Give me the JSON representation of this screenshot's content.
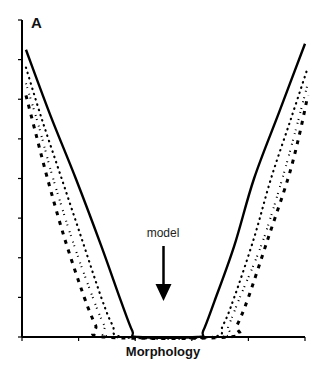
{
  "chart_data": {
    "type": "line",
    "title": "",
    "panel_label": "A",
    "xlabel": "Morphology",
    "ylabel": "",
    "x_tick_count": 6,
    "y_tick_count": 9,
    "x_tick_labels": [],
    "y_tick_labels": [],
    "xlim": [
      0,
      5
    ],
    "ylim": [
      0,
      8
    ],
    "grid": false,
    "legend": null,
    "annotations": [
      {
        "text": "model",
        "type": "arrow-down",
        "x": 2.5,
        "y_text": 2.6,
        "y_arrow_end": 0.9
      }
    ],
    "series": [
      {
        "name": "solid",
        "style": "solid",
        "x": [
          0.07,
          0.5,
          0.95,
          1.4,
          1.75,
          1.95,
          2.05,
          3.1,
          3.2,
          3.4,
          3.75,
          4.1,
          4.55,
          5.0
        ],
        "y": [
          7.25,
          5.6,
          4.0,
          2.3,
          0.9,
          0.15,
          0.0,
          0.0,
          0.15,
          0.9,
          2.3,
          4.0,
          5.7,
          7.4
        ]
      },
      {
        "name": "dotted",
        "style": "dotted",
        "x": [
          0.07,
          0.35,
          0.7,
          1.05,
          1.4,
          1.6,
          1.8,
          3.35,
          3.55,
          3.75,
          4.1,
          4.4,
          4.75,
          5.05
        ],
        "y": [
          6.8,
          5.5,
          4.0,
          2.5,
          1.0,
          0.3,
          0.0,
          0.0,
          0.3,
          1.0,
          2.5,
          4.0,
          5.5,
          6.8
        ]
      },
      {
        "name": "dash-dot",
        "style": "dashdot",
        "x": [
          0.07,
          0.3,
          0.55,
          0.9,
          1.25,
          1.45,
          1.6,
          3.5,
          3.65,
          3.85,
          4.25,
          4.6,
          4.85,
          5.05
        ],
        "y": [
          6.4,
          5.3,
          4.0,
          2.4,
          1.0,
          0.3,
          0.0,
          0.0,
          0.3,
          1.0,
          2.4,
          4.0,
          5.3,
          6.4
        ]
      },
      {
        "name": "dashed",
        "style": "dashed",
        "x": [
          0.07,
          0.25,
          0.45,
          0.75,
          1.1,
          1.3,
          1.45,
          3.65,
          3.8,
          4.0,
          4.35,
          4.7,
          4.9,
          5.05
        ],
        "y": [
          6.1,
          5.1,
          4.0,
          2.5,
          1.0,
          0.3,
          0.0,
          0.0,
          0.3,
          1.0,
          2.5,
          4.0,
          5.1,
          6.1
        ]
      }
    ]
  },
  "labels": {
    "panel": "A",
    "annotation": "model",
    "xlabel": "Morphology"
  },
  "colors": {
    "line": "#000000",
    "background": "#ffffff"
  }
}
